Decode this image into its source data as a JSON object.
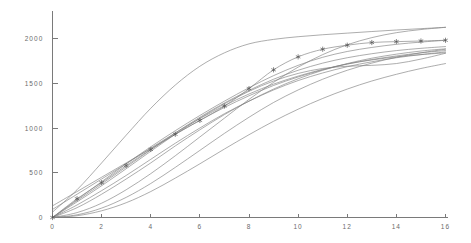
{
  "chart_data": {
    "type": "line",
    "title": "",
    "subtitle": "",
    "xlabel": "",
    "ylabel": "",
    "xlim": [
      0,
      16
    ],
    "ylim": [
      0,
      2150
    ],
    "grid": false,
    "legend": false,
    "legend_position": "none",
    "x_ticks": [
      0,
      2,
      4,
      6,
      8,
      10,
      12,
      14,
      16
    ],
    "x_tick_labels": [
      "0",
      "2",
      "4",
      "6",
      "8",
      "10",
      "12",
      "14",
      "16"
    ],
    "y_ticks": [
      0,
      500,
      1000,
      1500,
      2000
    ],
    "y_tick_labels": [
      "0",
      "500",
      "1000",
      "1500",
      "2000"
    ],
    "x": [
      0,
      1,
      2,
      3,
      4,
      5,
      6,
      7,
      8,
      9,
      10,
      11,
      12,
      13,
      14,
      15,
      16
    ],
    "line_color": "#808080",
    "marker_color": "#555555",
    "marker_symbol": "star",
    "series": [
      {
        "name": "series-1-marked",
        "marker": "star",
        "values": [
          0,
          210,
          390,
          580,
          760,
          930,
          1085,
          1245,
          1440,
          1650,
          1795,
          1880,
          1925,
          1955,
          1965,
          1972,
          1980
        ]
      },
      {
        "name": "series-2-fast",
        "marker": "none",
        "values": [
          60,
          310,
          610,
          920,
          1220,
          1480,
          1690,
          1840,
          1940,
          1990,
          2020,
          2042,
          2060,
          2078,
          2095,
          2110,
          2125
        ]
      },
      {
        "name": "series-3",
        "marker": "none",
        "values": [
          0,
          200,
          400,
          600,
          790,
          970,
          1140,
          1300,
          1450,
          1585,
          1700,
          1790,
          1855,
          1900,
          1935,
          1960,
          1980
        ]
      },
      {
        "name": "series-4",
        "marker": "none",
        "values": [
          0,
          190,
          375,
          565,
          755,
          945,
          1120,
          1280,
          1420,
          1545,
          1645,
          1725,
          1785,
          1830,
          1865,
          1890,
          1910
        ]
      },
      {
        "name": "series-5",
        "marker": "none",
        "values": [
          130,
          290,
          450,
          610,
          770,
          930,
          1085,
          1230,
          1360,
          1475,
          1570,
          1650,
          1715,
          1765,
          1805,
          1840,
          1865
        ]
      },
      {
        "name": "series-6",
        "marker": "none",
        "values": [
          90,
          260,
          430,
          600,
          775,
          945,
          1105,
          1250,
          1380,
          1490,
          1580,
          1655,
          1715,
          1760,
          1795,
          1820,
          1840
        ]
      },
      {
        "name": "series-7",
        "marker": "none",
        "values": [
          0,
          140,
          300,
          470,
          650,
          830,
          1000,
          1160,
          1300,
          1425,
          1530,
          1615,
          1685,
          1740,
          1785,
          1820,
          1850
        ]
      },
      {
        "name": "series-8",
        "marker": "none",
        "values": [
          0,
          110,
          260,
          430,
          610,
          800,
          980,
          1150,
          1300,
          1435,
          1550,
          1645,
          1720,
          1780,
          1825,
          1860,
          1885
        ]
      },
      {
        "name": "series-9-crossing",
        "marker": "none",
        "values": [
          0,
          55,
          160,
          310,
          490,
          690,
          900,
          1110,
          1320,
          1510,
          1680,
          1820,
          1930,
          2010,
          2065,
          2100,
          2125
        ]
      },
      {
        "name": "series-10-slow",
        "marker": "none",
        "values": [
          0,
          30,
          105,
          225,
          380,
          560,
          750,
          940,
          1120,
          1285,
          1425,
          1545,
          1645,
          1725,
          1790,
          1840,
          1880
        ]
      },
      {
        "name": "series-11-slowest",
        "marker": "none",
        "values": [
          0,
          20,
          75,
          165,
          290,
          440,
          600,
          765,
          925,
          1075,
          1210,
          1330,
          1435,
          1525,
          1600,
          1665,
          1720
        ]
      },
      {
        "name": "series-12-dip",
        "marker": "none",
        "values": [
          0,
          175,
          355,
          545,
          740,
          930,
          1110,
          1270,
          1410,
          1525,
          1610,
          1665,
          1690,
          1700,
          1720,
          1770,
          1835
        ]
      }
    ]
  },
  "axes": {
    "y_axis_name": "value-axis",
    "x_axis_name": "time-axis"
  }
}
